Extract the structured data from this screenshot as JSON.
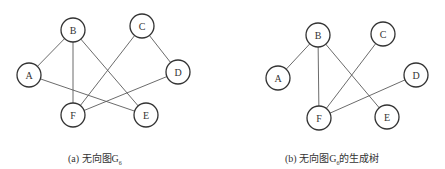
{
  "figures": [
    {
      "id": "a",
      "caption_prefix": "(a)",
      "caption_text": "无向图G",
      "caption_sub": "6",
      "caption_suffix": "",
      "node_radius": 12,
      "nodes": [
        {
          "label": "A",
          "x": 29,
          "y": 75
        },
        {
          "label": "B",
          "x": 73,
          "y": 30
        },
        {
          "label": "C",
          "x": 142,
          "y": 26
        },
        {
          "label": "D",
          "x": 178,
          "y": 72
        },
        {
          "label": "E",
          "x": 146,
          "y": 115
        },
        {
          "label": "F",
          "x": 73,
          "y": 115
        }
      ],
      "edges": [
        [
          "A",
          "B"
        ],
        [
          "B",
          "F"
        ],
        [
          "B",
          "E"
        ],
        [
          "A",
          "E"
        ],
        [
          "C",
          "F"
        ],
        [
          "C",
          "D"
        ],
        [
          "D",
          "F"
        ]
      ]
    },
    {
      "id": "b",
      "caption_prefix": "(b)",
      "caption_text": "无向图G",
      "caption_sub": "6",
      "caption_suffix": "的生成树",
      "node_radius": 12,
      "nodes": [
        {
          "label": "A",
          "x": 278,
          "y": 78
        },
        {
          "label": "B",
          "x": 318,
          "y": 35
        },
        {
          "label": "C",
          "x": 383,
          "y": 34
        },
        {
          "label": "D",
          "x": 416,
          "y": 75
        },
        {
          "label": "E",
          "x": 387,
          "y": 117
        },
        {
          "label": "F",
          "x": 319,
          "y": 118
        }
      ],
      "edges": [
        [
          "A",
          "B"
        ],
        [
          "B",
          "F"
        ],
        [
          "B",
          "E"
        ],
        [
          "C",
          "F"
        ],
        [
          "D",
          "F"
        ]
      ]
    }
  ]
}
